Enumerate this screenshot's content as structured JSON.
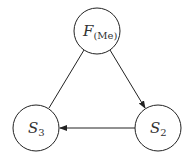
{
  "diagram": {
    "nodes": [
      {
        "id": "F",
        "label": "F",
        "subscript": "(Me)",
        "cx": 97,
        "cy": 31,
        "r": 23
      },
      {
        "id": "S2",
        "label": "S",
        "subscript": "2",
        "cx": 158,
        "cy": 128,
        "r": 23
      },
      {
        "id": "S3",
        "label": "S",
        "subscript": "3",
        "cx": 36,
        "cy": 128,
        "r": 23
      }
    ],
    "edges": [
      {
        "from": "F",
        "to": "S2",
        "arrow": true
      },
      {
        "from": "S2",
        "to": "S3",
        "arrow": true
      },
      {
        "from": "F",
        "to": "S3",
        "arrow": false
      }
    ],
    "colors": {
      "stroke": "#222222",
      "text": "#333333",
      "background": "#ffffff"
    }
  }
}
